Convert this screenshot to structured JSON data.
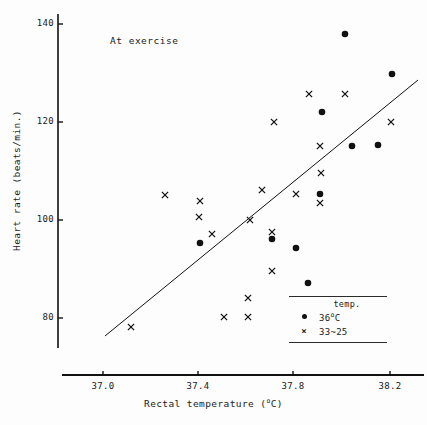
{
  "figure": {
    "annotation": "At exercise",
    "caption": ""
  },
  "axes": {
    "y": {
      "label": "Heart rate (beats/min.)",
      "ticks": [
        {
          "value": 140,
          "label": "140",
          "py": 24
        },
        {
          "value": 120,
          "label": "120",
          "py": 122
        },
        {
          "value": 100,
          "label": "100",
          "py": 220
        },
        {
          "value": 80,
          "label": "80",
          "py": 318
        }
      ],
      "axis_x_px": 58,
      "axis_top_px": 14,
      "axis_bottom_px": 348
    },
    "x": {
      "label_main": "Rectal temperature (",
      "label_sup": "o",
      "label_tail": "C)",
      "ticks": [
        {
          "value": 37.0,
          "label": "37.0",
          "px": 103
        },
        {
          "value": 37.4,
          "label": "37.4",
          "px": 198
        },
        {
          "value": 37.8,
          "label": "37.8",
          "px": 293
        },
        {
          "value": 38.2,
          "label": "38.2",
          "px": 390
        }
      ],
      "axis_y_px": 375,
      "axis_left_px": 62,
      "axis_right_px": 424
    }
  },
  "legend": {
    "title": "temp.",
    "entries": [
      {
        "marker": "dot",
        "label_main": "36",
        "label_sup": "o",
        "label_tail": "C"
      },
      {
        "marker": "x",
        "label_main": "33~25",
        "label_sup": "",
        "label_tail": ""
      }
    ]
  },
  "chart_data": {
    "type": "scatter",
    "title": "",
    "annotation": "At exercise",
    "xlabel": "Rectal temperature (oC)",
    "ylabel": "Heart rate (beats/min.)",
    "xlim": [
      36.88,
      38.35
    ],
    "ylim": [
      72,
      143
    ],
    "grid": false,
    "legend_position": "bottom-right",
    "series": [
      {
        "name": "36oC",
        "marker": "dot",
        "points": [
          {
            "x": 37.4,
            "y": 92.0,
            "px": 200,
            "py": 243
          },
          {
            "x": 37.72,
            "y": 95.8,
            "px": 272,
            "py": 239
          },
          {
            "x": 37.83,
            "y": 94.0,
            "px": 296,
            "py": 248
          },
          {
            "x": 37.87,
            "y": 87.2,
            "px": 308,
            "py": 283
          },
          {
            "x": 37.89,
            "y": 104.8,
            "px": 320,
            "py": 194
          },
          {
            "x": 37.89,
            "y": 121.8,
            "px": 322,
            "py": 112
          },
          {
            "x": 38.0,
            "y": 137.8,
            "px": 345,
            "py": 34
          },
          {
            "x": 38.03,
            "y": 115.0,
            "px": 352,
            "py": 146
          },
          {
            "x": 38.15,
            "y": 115.3,
            "px": 378,
            "py": 145
          },
          {
            "x": 38.2,
            "y": 130.0,
            "px": 392,
            "py": 74
          }
        ]
      },
      {
        "name": "33~25",
        "marker": "x",
        "points": [
          {
            "x": 37.12,
            "y": 78.2,
            "px": 131,
            "py": 327
          },
          {
            "x": 37.27,
            "y": 104.8,
            "px": 165,
            "py": 195
          },
          {
            "x": 37.4,
            "y": 103.0,
            "px": 200,
            "py": 201
          },
          {
            "x": 37.4,
            "y": 100.3,
            "px": 199,
            "py": 217
          },
          {
            "x": 37.46,
            "y": 93.5,
            "px": 212,
            "py": 234
          },
          {
            "x": 37.6,
            "y": 80.0,
            "px": 224,
            "py": 317
          },
          {
            "x": 37.65,
            "y": 80.0,
            "px": 248,
            "py": 317
          },
          {
            "x": 37.65,
            "y": 83.8,
            "px": 248,
            "py": 298
          },
          {
            "x": 37.6,
            "y": 100.0,
            "px": 250,
            "py": 220
          },
          {
            "x": 37.72,
            "y": 105.8,
            "px": 262,
            "py": 190
          },
          {
            "x": 37.73,
            "y": 97.2,
            "px": 272,
            "py": 232
          },
          {
            "x": 37.75,
            "y": 91.0,
            "px": 272,
            "py": 271
          },
          {
            "x": 37.76,
            "y": 119.8,
            "px": 274,
            "py": 122
          },
          {
            "x": 37.82,
            "y": 104.8,
            "px": 296,
            "py": 194
          },
          {
            "x": 37.86,
            "y": 126.0,
            "px": 309,
            "py": 94
          },
          {
            "x": 37.88,
            "y": 110.0,
            "px": 321,
            "py": 173
          },
          {
            "x": 37.89,
            "y": 103.0,
            "px": 320,
            "py": 203
          },
          {
            "x": 37.89,
            "y": 115.0,
            "px": 320,
            "py": 146
          },
          {
            "x": 38.0,
            "y": 126.0,
            "px": 345,
            "py": 94
          },
          {
            "x": 38.2,
            "y": 119.8,
            "px": 391,
            "py": 122
          }
        ]
      }
    ],
    "trendline": {
      "x_start": 37.0,
      "y_start": 76.0,
      "x_end": 38.28,
      "y_end": 129.5,
      "px_start": 105,
      "py_start": 336,
      "px_end": 418,
      "py_end": 80
    }
  }
}
